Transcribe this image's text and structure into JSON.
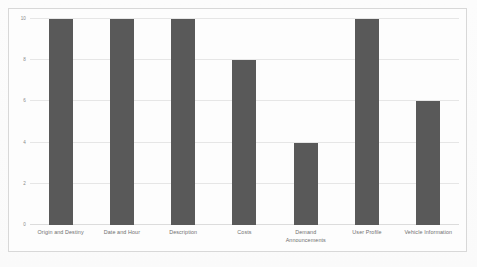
{
  "chart_data": {
    "type": "bar",
    "title": "",
    "subtitle": "",
    "xlabel": "",
    "ylabel": "",
    "ylim": [
      0,
      10
    ],
    "yticks": [
      0,
      2,
      4,
      6,
      8,
      10
    ],
    "ytick_labels": [
      "0",
      "2",
      "4",
      "6",
      "8",
      "10"
    ],
    "grid": true,
    "legend": false,
    "legend_position": "none",
    "bar_color": "#595959",
    "gridline_color": "#e6e6e6",
    "frame_color": "#d8d8d8",
    "background_color": "#fdfdfd",
    "categories": [
      "Origin and Destiny",
      "Date and Hour",
      "Description",
      "Costs",
      "Demand Announcements",
      "User Profile",
      "Vehicle Information"
    ],
    "values": [
      10,
      10,
      10,
      8,
      4,
      10,
      6
    ]
  }
}
